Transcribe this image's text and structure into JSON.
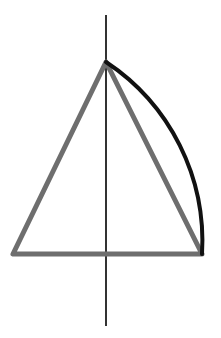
{
  "diagram": {
    "canvas": {
      "width": 221,
      "height": 338,
      "background": "#ffffff"
    },
    "axis": {
      "x": 106,
      "y1": 15,
      "y2": 326,
      "color": "#333333",
      "width": 2
    },
    "triangle": {
      "apex": [
        106,
        62
      ],
      "bottom_left": [
        13,
        254
      ],
      "bottom_right": [
        202,
        254
      ],
      "color": "#6e6e6e",
      "width": 5
    },
    "arc": {
      "from": [
        106,
        62
      ],
      "to": [
        202,
        254
      ],
      "radius": 215,
      "color": "#111111",
      "width": 4
    }
  }
}
